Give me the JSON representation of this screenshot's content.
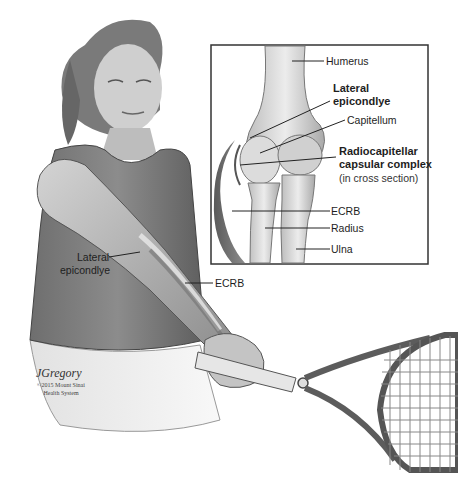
{
  "figure": {
    "inset": {
      "labels": {
        "humerus": "Humerus",
        "lateral_epicondyle_line1": "Lateral",
        "lateral_epicondyle_line2": "epicondlye",
        "capitellum": "Capitellum",
        "radiocapitellar_line1": "Radiocapitellar",
        "radiocapitellar_line2": "capsular complex",
        "radiocapitellar_note": "(in cross section)",
        "ecrb": "ECRB",
        "radius": "Radius",
        "ulna": "Ulna"
      }
    },
    "arm_labels": {
      "lateral_line1": "Lateral",
      "lateral_line2": "epicondlye",
      "ecrb": "ECRB"
    },
    "credit": {
      "signature": "JGregory",
      "line1": "©2015 Mount Sinai",
      "line2": "Health System"
    }
  }
}
